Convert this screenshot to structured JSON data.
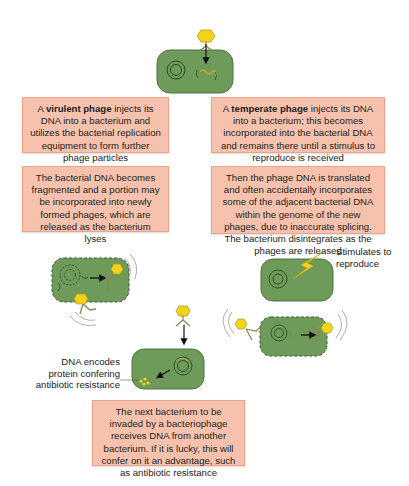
{
  "boxes": {
    "virulent": {
      "pre": "A ",
      "bold": "virulent phage",
      "post": " injects its DNA into a bacterium and utilizes the bacterial replication equipment to form further phage particles"
    },
    "temperate": {
      "pre": "A ",
      "bold": "temperate phage",
      "post": " injects its DNA into a bacterium; this becomes incorporated into the bacterial DNA and remains there until a stimulus to reproduce is received"
    },
    "lysis": "The bacterial DNA becomes fragmented and a portion may be incorporated into newly formed phages, which are released as the bacterium lyses",
    "translation": "Then the phage DNA is translated and often accidentally incorporates some of the adjacent bacterial DNA within the genome of the new phages, due to inaccurate splicing. The bacterium disintegrates as the phages are released",
    "next": "The next bacterium to be invaded by a bacteriophage receives DNA from another bacterium. If it is lucky, this will confer on it an advantage, such as antibiotic resistance"
  },
  "labels": {
    "stimulates": "Stimulates to reproduce",
    "dna_encodes": "DNA encodes protein confering antibiotic resistance"
  },
  "colors": {
    "box_fill": "#f6c2ad",
    "bacterium_fill": "#6e9a5a",
    "phage_head": "#f3d21c"
  }
}
